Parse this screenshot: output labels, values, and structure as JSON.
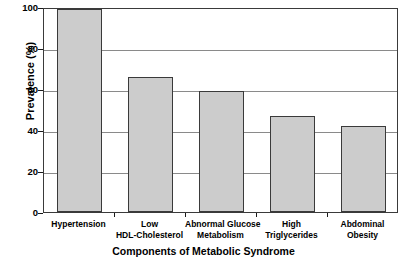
{
  "chart_data": {
    "type": "bar",
    "title": "",
    "xlabel": "Components of Metabolic Syndrome",
    "ylabel": "Prevalence (%)",
    "categories": [
      "Hypertension",
      "Low HDL-Cholesterol",
      "Abnormal Glucose Metabolism",
      "High Triglycerides",
      "Abdominal Obesity"
    ],
    "category_lines": [
      [
        "Hypertension"
      ],
      [
        "Low",
        "HDL-Cholesterol"
      ],
      [
        "Abnormal Glucose",
        "Metabolism"
      ],
      [
        "High",
        "Triglycerides"
      ],
      [
        "Abdominal",
        "Obesity"
      ]
    ],
    "values": [
      99,
      66,
      59,
      47,
      42
    ],
    "ylim": [
      0,
      100
    ],
    "ytick_values": [
      0,
      20,
      40,
      60,
      80,
      100
    ],
    "ytick_labels": [
      "0",
      "20",
      "40",
      "60",
      "80",
      "100"
    ],
    "grid": "horizontal",
    "legend": "none",
    "bar_fill_color": "#cccccc",
    "bar_edge_color": "#3a3a3a",
    "gridline_color": "#8a8a8a",
    "axis_color": "#1a1a1a",
    "background_color": "#ffffff"
  }
}
